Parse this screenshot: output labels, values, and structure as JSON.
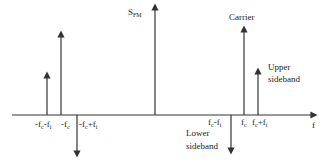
{
  "diagram": {
    "title_label": {
      "main": "S",
      "sub": "FM"
    },
    "axis_label": "f",
    "annotations": {
      "carrier": "Carrier",
      "upper_sideband_line1": "Upper",
      "upper_sideband_line2": "sideband",
      "lower_sideband_line1": "Lower",
      "lower_sideband_line2": "sideband"
    },
    "tick_labels": [
      {
        "id": "neg_fc_minus_fi",
        "parts": [
          "-f",
          "c",
          "-f",
          "i"
        ]
      },
      {
        "id": "neg_fc",
        "parts": [
          "-f",
          "c"
        ]
      },
      {
        "id": "neg_fc_plus_fi",
        "parts": [
          "-f",
          "c",
          "+f",
          "i"
        ]
      },
      {
        "id": "fc_minus_fi",
        "parts": [
          "f",
          "c",
          "-f",
          "i"
        ]
      },
      {
        "id": "fc",
        "parts": [
          "f",
          "c"
        ]
      },
      {
        "id": "fc_plus_fi",
        "parts": [
          "f",
          "c",
          "+f",
          "i"
        ]
      }
    ],
    "spectral_lines": [
      {
        "position": "-fc-fi",
        "direction": "up",
        "relative_amplitude": 0.5
      },
      {
        "position": "-fc",
        "direction": "up",
        "relative_amplitude": 1.0
      },
      {
        "position": "-fc+fi",
        "direction": "down",
        "relative_amplitude": 0.5
      },
      {
        "position": "0",
        "direction": "up",
        "relative_amplitude": 1.3
      },
      {
        "position": "fc-fi",
        "direction": "down",
        "relative_amplitude": 0.45,
        "label": "Lower sideband"
      },
      {
        "position": "fc",
        "direction": "up",
        "relative_amplitude": 1.0,
        "label": "Carrier"
      },
      {
        "position": "fc+fi",
        "direction": "up",
        "relative_amplitude": 0.5,
        "label": "Upper sideband"
      }
    ],
    "colors": {
      "line": "#333333",
      "text": "#222222",
      "background": "#ffffff"
    }
  }
}
